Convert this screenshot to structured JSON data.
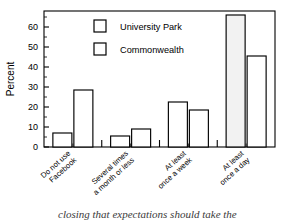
{
  "chart_data": {
    "type": "bar",
    "title": "",
    "subtitle": "",
    "xlabel": "",
    "ylabel": "Percent",
    "ylim": [
      0,
      68
    ],
    "ytick_values": [
      0,
      10,
      20,
      30,
      40,
      50,
      60
    ],
    "ytick_labels": [
      "0",
      "10",
      "20",
      "30",
      "40",
      "50",
      "60"
    ],
    "grid": false,
    "legend_position": "top-center",
    "categories": [
      "Do not use Facebook",
      "Several times a month or less",
      "At least once a week",
      "At least once a day"
    ],
    "category_lines": [
      [
        "Do not use",
        "Facebook"
      ],
      [
        "Several times",
        "a month or less"
      ],
      [
        "At least",
        "once a week"
      ],
      [
        "At least",
        "once a day"
      ]
    ],
    "series": [
      {
        "name": "University Park",
        "values": [
          7,
          5.5,
          22.5,
          66
        ],
        "fill": "#ffffff",
        "edge": "#000000"
      },
      {
        "name": "Commonwealth",
        "values": [
          28.5,
          9,
          18.5,
          45.5
        ],
        "fill": "#ffffff",
        "edge": "#000000"
      }
    ]
  },
  "axes": {
    "y_title": "Percent",
    "y_ticks": [
      "60",
      "50",
      "40",
      "30",
      "20",
      "10",
      "0"
    ]
  },
  "legend": {
    "items": [
      {
        "label": "University Park"
      },
      {
        "label": "Commonwealth"
      }
    ]
  },
  "caption": {
    "text": "closing that expectations should take the"
  },
  "colors": {
    "bar_fill": "#ffffff",
    "bar_fill_tall": "#f2f2f2",
    "bar_edge": "#000000",
    "axis": "#000000",
    "text": "#000000"
  }
}
